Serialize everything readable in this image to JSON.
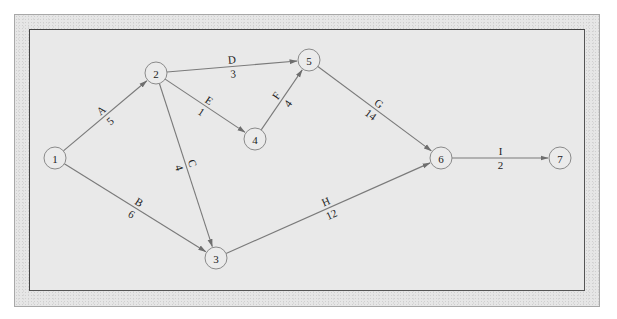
{
  "diagram": {
    "type": "activity-on-arrow network",
    "nodes": [
      {
        "id": "1",
        "label": "1",
        "x": 55,
        "y": 158
      },
      {
        "id": "2",
        "label": "2",
        "x": 156,
        "y": 73
      },
      {
        "id": "3",
        "label": "3",
        "x": 216,
        "y": 258
      },
      {
        "id": "4",
        "label": "4",
        "x": 255,
        "y": 139
      },
      {
        "id": "5",
        "label": "5",
        "x": 309,
        "y": 60
      },
      {
        "id": "6",
        "label": "6",
        "x": 441,
        "y": 158
      },
      {
        "id": "7",
        "label": "7",
        "x": 560,
        "y": 158
      }
    ],
    "edges": [
      {
        "from": "1",
        "to": "2",
        "activity": "A",
        "duration": "5"
      },
      {
        "from": "1",
        "to": "3",
        "activity": "B",
        "duration": "6"
      },
      {
        "from": "2",
        "to": "3",
        "activity": "C",
        "duration": "4"
      },
      {
        "from": "2",
        "to": "5",
        "activity": "D",
        "duration": "3"
      },
      {
        "from": "2",
        "to": "4",
        "activity": "E",
        "duration": "1"
      },
      {
        "from": "4",
        "to": "5",
        "activity": "F",
        "duration": "4"
      },
      {
        "from": "5",
        "to": "6",
        "activity": "G",
        "duration": "14"
      },
      {
        "from": "3",
        "to": "6",
        "activity": "H",
        "duration": "12"
      },
      {
        "from": "6",
        "to": "7",
        "activity": "I",
        "duration": "2"
      }
    ]
  },
  "colors": {
    "frame_bg": "#e6e6e6",
    "panel_bg": "#e9e9e9",
    "edge": "#7a7a7a",
    "node_stroke": "#8a8a8a",
    "text": "#222222"
  }
}
